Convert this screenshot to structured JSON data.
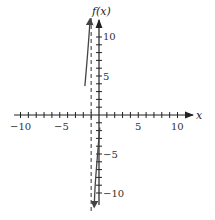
{
  "chart_data": {
    "type": "line",
    "title": "",
    "xlabel": "x",
    "ylabel": "f(x)",
    "xlim": [
      -10,
      10
    ],
    "ylim": [
      -10,
      10
    ],
    "x_ticks_labeled": [
      -10,
      -5,
      5,
      10
    ],
    "y_ticks_labeled": [
      -10,
      -5,
      5,
      10
    ],
    "tick_spacing": 1,
    "grid": false,
    "vertical_asymptote": {
      "x": -1,
      "style": "dashed"
    },
    "series": [
      {
        "name": "left branch",
        "points": [
          [
            -1.8,
            3.7
          ],
          [
            -1.6,
            6.0
          ],
          [
            -1.4,
            8.5
          ],
          [
            -1.25,
            10.5
          ],
          [
            -1.15,
            12.0
          ]
        ],
        "end_arrow": "up"
      },
      {
        "name": "right branch",
        "points": [
          [
            0.1,
            -1.6
          ],
          [
            -0.1,
            -4.0
          ],
          [
            -0.3,
            -6.5
          ],
          [
            -0.5,
            -9.0
          ],
          [
            -0.6,
            -11.5
          ]
        ],
        "end_arrow": "down"
      }
    ]
  },
  "labels": {
    "x_axis": "x",
    "y_axis": "f(x)",
    "x_ticks": {
      "neg10": "−10",
      "neg5": "−5",
      "pos5": "5",
      "pos10": "10"
    },
    "y_ticks": {
      "pos10": "10",
      "pos5": "5",
      "neg5": "−5",
      "neg10": "−10"
    }
  }
}
